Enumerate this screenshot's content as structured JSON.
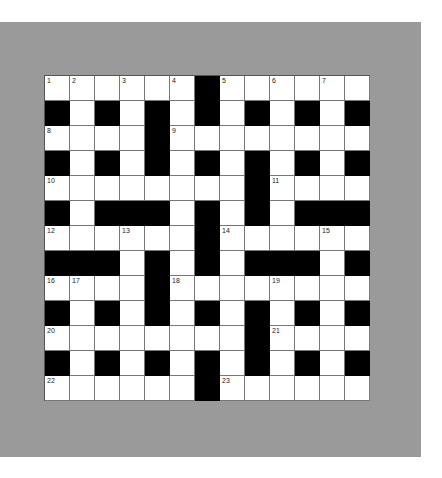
{
  "puzzle": {
    "rows": 13,
    "cols": 13,
    "colors": {
      "background": "#9a9a9a",
      "black_cell": "#000000",
      "white_cell": "#ffffff"
    },
    "grid": [
      [
        "1",
        "2",
        "",
        "3",
        "",
        "4",
        "#",
        "5",
        "",
        "6",
        "",
        "7",
        ""
      ],
      [
        "#",
        "",
        "#",
        "",
        "#",
        "",
        "#",
        "",
        "#",
        "",
        "#",
        "",
        "#"
      ],
      [
        "8",
        "",
        "",
        "",
        "#",
        "9",
        "",
        "",
        "",
        "",
        "",
        "",
        ""
      ],
      [
        "#",
        "",
        "#",
        "",
        "#",
        "",
        "#",
        "",
        "#",
        "",
        "#",
        "",
        "#"
      ],
      [
        "10",
        "",
        "",
        "",
        "",
        "",
        "",
        "",
        "#",
        "11",
        "",
        "",
        ""
      ],
      [
        "#",
        "",
        "#",
        "#",
        "#",
        "",
        "#",
        "",
        "#",
        "",
        "#",
        "#",
        "#"
      ],
      [
        "12",
        "",
        "",
        "13",
        "",
        "",
        "#",
        "14",
        "",
        "",
        "",
        "15",
        ""
      ],
      [
        "#",
        "#",
        "#",
        "",
        "#",
        "",
        "#",
        "",
        "#",
        "#",
        "#",
        "",
        "#"
      ],
      [
        "16",
        "17",
        "",
        "",
        "#",
        "18",
        "",
        "",
        "",
        "19",
        "",
        "",
        ""
      ],
      [
        "#",
        "",
        "#",
        "",
        "#",
        "",
        "#",
        "",
        "#",
        "",
        "#",
        "",
        "#"
      ],
      [
        "20",
        "",
        "",
        "",
        "",
        "",
        "",
        "",
        "#",
        "21",
        "",
        "",
        ""
      ],
      [
        "#",
        "",
        "#",
        "",
        "#",
        "",
        "#",
        "",
        "#",
        "",
        "#",
        "",
        "#"
      ],
      [
        "22",
        "",
        "",
        "",
        "",
        "",
        "#",
        "23",
        "",
        "",
        "",
        "",
        ""
      ]
    ]
  }
}
